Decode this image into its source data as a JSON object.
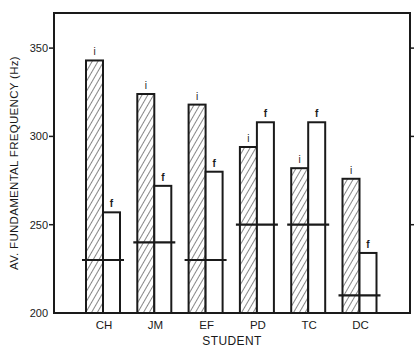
{
  "chart_data": {
    "type": "bar",
    "title": "",
    "xlabel": "STUDENT",
    "ylabel": "AV. FUNDAMENTAL FREQUENCY (Hz)",
    "ylim": [
      200,
      370
    ],
    "yticks": [
      200,
      250,
      300,
      350
    ],
    "grid": false,
    "categories": [
      "CH",
      "JM",
      "EF",
      "PD",
      "TC",
      "DC"
    ],
    "series": [
      {
        "name": "i",
        "label": "i",
        "pattern": "hatched",
        "values": [
          343,
          324,
          318,
          294,
          282,
          276
        ]
      },
      {
        "name": "f",
        "label": "f",
        "pattern": "open",
        "values": [
          257,
          272,
          280,
          308,
          308,
          234
        ]
      }
    ],
    "reference_lines": {
      "name": "horizontal bar marker",
      "values": [
        230,
        240,
        230,
        250,
        250,
        210
      ]
    }
  }
}
